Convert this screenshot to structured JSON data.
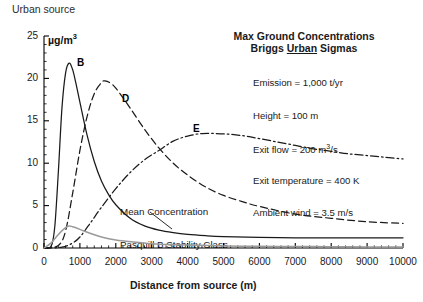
{
  "figure": {
    "urban_source_label": "Urban source",
    "unit_label_main": "µg/m",
    "unit_label_sup": "3",
    "title": "Max Ground Concentrations",
    "subtitle_pre": "Briggs ",
    "subtitle_underlined": "Urban",
    "subtitle_post": " Sigmas",
    "annotation_line1": "Mean Concentration",
    "annotation_line2": "Pasquill B Stability Class",
    "params": [
      {
        "text": "Emission = 1,000 t/yr"
      },
      {
        "text": "Height = 100 m"
      },
      {
        "text_pre": "Exit flow = 200 m",
        "sup": "3",
        "text_post": "/s"
      },
      {
        "text": "Exit temperature = 400 K"
      },
      {
        "text": "Ambient wind = 3.5 m/s"
      }
    ],
    "curve_labels": [
      {
        "name": "B",
        "x": 77,
        "y": 57
      },
      {
        "name": "D",
        "x": 122,
        "y": 93
      },
      {
        "name": "E",
        "x": 193,
        "y": 123
      }
    ],
    "colors": {
      "axis": "#000000",
      "curve_b": "#1a1a1a",
      "curve_d": "#1a1a1a",
      "curve_e": "#1a1a1a",
      "curve_mean": "#2a2a2a",
      "curve_gray": "#9a9a9a",
      "background": "#ffffff"
    }
  },
  "chart_data": {
    "type": "line",
    "xlabel": "Distance from source (m)",
    "ylabel": "µg/m3",
    "xlim": [
      0,
      10000
    ],
    "ylim": [
      0,
      25
    ],
    "xticks": [
      0,
      1000,
      2000,
      3000,
      4000,
      5000,
      6000,
      7000,
      8000,
      9000,
      10000
    ],
    "xtick_labels": [
      "0",
      "1000",
      "2000",
      "3000",
      "4000",
      "5000",
      "6000",
      "7000",
      "8000",
      "9000",
      "10000"
    ],
    "yticks": [
      0,
      5,
      10,
      15,
      20,
      25
    ],
    "ytick_labels": [
      "0",
      "5",
      "10",
      "15",
      "20",
      "25"
    ],
    "x_minor_tick_interval": 200,
    "y_minor_tick_interval": 1,
    "grid": false,
    "legend": "inline-curve-labels",
    "annotations": [
      {
        "text": "Mean Concentration",
        "x": 2700,
        "y": 6.4
      },
      {
        "text": "Pasquill B Stability Class",
        "x": 2700,
        "y": 5.0
      },
      {
        "text": "Emission = 1,000 t/yr"
      },
      {
        "text": "Height = 100 m"
      },
      {
        "text": "Exit flow = 200 m3/s"
      },
      {
        "text": "Exit temperature = 400 K"
      },
      {
        "text": "Ambient wind = 3.5 m/s"
      }
    ],
    "series": [
      {
        "name": "B",
        "label": "B",
        "style": "solid",
        "color": "#1a1a1a",
        "x": [
          0,
          200,
          300,
          400,
          500,
          600,
          700,
          800,
          900,
          1000,
          1200,
          1400,
          1600,
          1800,
          2000,
          2400,
          2800,
          3200,
          3600,
          4000,
          4500,
          5000,
          6000,
          7000,
          8000,
          9000,
          10000
        ],
        "values": [
          0,
          0.2,
          2.5,
          9.0,
          16.5,
          20.6,
          21.8,
          21.0,
          19.2,
          17.2,
          13.3,
          10.2,
          7.9,
          6.3,
          5.1,
          3.5,
          2.6,
          2.1,
          1.8,
          1.6,
          1.45,
          1.35,
          1.25,
          1.2,
          1.2,
          1.2,
          1.2
        ]
      },
      {
        "name": "D",
        "label": "D",
        "style": "dashed",
        "color": "#1a1a1a",
        "x": [
          0,
          400,
          600,
          800,
          1000,
          1200,
          1400,
          1600,
          1700,
          1900,
          2100,
          2400,
          2800,
          3200,
          3600,
          4000,
          4500,
          5000,
          5500,
          6000,
          7000,
          8000,
          9000,
          10000
        ],
        "values": [
          0,
          0.3,
          2.0,
          6.5,
          11.5,
          15.5,
          18.2,
          19.5,
          19.7,
          19.3,
          18.3,
          16.5,
          14.0,
          11.8,
          10.0,
          8.6,
          7.2,
          6.2,
          5.5,
          4.9,
          4.0,
          3.5,
          3.1,
          2.9
        ]
      },
      {
        "name": "E",
        "label": "E",
        "style": "dash-dot",
        "color": "#1a1a1a",
        "x": [
          0,
          500,
          800,
          1000,
          1300,
          1600,
          2000,
          2400,
          2800,
          3200,
          3600,
          4000,
          4400,
          4800,
          5200,
          5600,
          6000,
          6500,
          7000,
          7500,
          8000,
          8500,
          9000,
          9500,
          10000
        ],
        "values": [
          0,
          0.1,
          0.6,
          1.3,
          3.0,
          4.8,
          7.0,
          8.9,
          10.4,
          11.5,
          12.6,
          13.2,
          13.5,
          13.5,
          13.4,
          13.2,
          12.9,
          12.5,
          12.1,
          11.7,
          11.4,
          11.1,
          10.9,
          10.7,
          10.5
        ]
      },
      {
        "name": "Mean Concentration Pasquill B",
        "label": "Mean Concentration Pasquill B Stability Class",
        "style": "solid-gray",
        "color": "#9a9a9a",
        "x": [
          0,
          200,
          400,
          600,
          700,
          800,
          1000,
          1300,
          1600,
          2000,
          2500,
          3000,
          3500,
          4000,
          5000,
          6000,
          7000,
          8000,
          9000,
          10000
        ],
        "values": [
          0,
          0.6,
          1.6,
          2.4,
          2.6,
          2.5,
          2.2,
          1.7,
          1.3,
          0.95,
          0.7,
          0.5,
          0.4,
          0.35,
          0.25,
          0.2,
          0.18,
          0.15,
          0.13,
          0.12
        ]
      }
    ]
  }
}
